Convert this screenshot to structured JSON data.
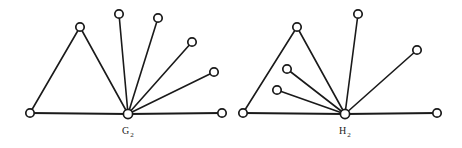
{
  "figure": {
    "background_color": "#ffffff",
    "ink_color": "#1a1a1a",
    "width": 462,
    "height": 148,
    "caption": ""
  },
  "graphs": [
    {
      "id": "G2",
      "label_base": "G",
      "label_subscript": "2",
      "label_full": "G2",
      "label_position": {
        "x": 128,
        "y": 134
      },
      "node_count": 8,
      "edge_count": 8,
      "hub_node_id": "g-hub",
      "nodes": [
        {
          "id": "g-base-left",
          "name": "base-left-vertex",
          "x": 30,
          "y": 113,
          "r": 4.2
        },
        {
          "id": "g-apex",
          "name": "triangle-apex",
          "x": 80,
          "y": 27,
          "r": 4.2
        },
        {
          "id": "g-hub",
          "name": "hub-vertex",
          "x": 128,
          "y": 114,
          "r": 4.6
        },
        {
          "id": "g-fan-1",
          "name": "fan-vertex-1",
          "x": 119,
          "y": 14,
          "r": 4.2
        },
        {
          "id": "g-fan-2",
          "name": "fan-vertex-2",
          "x": 158,
          "y": 18,
          "r": 4.2
        },
        {
          "id": "g-fan-3",
          "name": "fan-vertex-3",
          "x": 192,
          "y": 42,
          "r": 4.2
        },
        {
          "id": "g-fan-4",
          "name": "fan-vertex-4",
          "x": 214,
          "y": 72,
          "r": 4.2
        },
        {
          "id": "g-base-right",
          "name": "base-right-vertex",
          "x": 222,
          "y": 113,
          "r": 4.2
        }
      ],
      "edges": [
        {
          "from": "g-base-left",
          "to": "g-apex",
          "kind": "triangle"
        },
        {
          "from": "g-apex",
          "to": "g-hub",
          "kind": "triangle"
        },
        {
          "from": "g-base-left",
          "to": "g-hub",
          "kind": "base"
        },
        {
          "from": "g-hub",
          "to": "g-fan-1",
          "kind": "spoke"
        },
        {
          "from": "g-hub",
          "to": "g-fan-2",
          "kind": "spoke"
        },
        {
          "from": "g-hub",
          "to": "g-fan-3",
          "kind": "spoke"
        },
        {
          "from": "g-hub",
          "to": "g-fan-4",
          "kind": "spoke"
        },
        {
          "from": "g-hub",
          "to": "g-base-right",
          "kind": "base"
        }
      ]
    },
    {
      "id": "H2",
      "label_base": "H",
      "label_subscript": "2",
      "label_full": "H2",
      "label_position": {
        "x": 345,
        "y": 134
      },
      "node_count": 8,
      "edge_count": 8,
      "hub_node_id": "h-hub",
      "nodes": [
        {
          "id": "h-base-left",
          "name": "base-left-vertex",
          "x": 243,
          "y": 113,
          "r": 4.2
        },
        {
          "id": "h-apex",
          "name": "triangle-apex",
          "x": 297,
          "y": 27,
          "r": 4.2
        },
        {
          "id": "h-hub",
          "name": "hub-vertex",
          "x": 345,
          "y": 114,
          "r": 4.6
        },
        {
          "id": "h-pendant-1",
          "name": "pendant-vertex-1",
          "x": 287,
          "y": 69,
          "r": 4.2
        },
        {
          "id": "h-pendant-2",
          "name": "pendant-vertex-2",
          "x": 277,
          "y": 90,
          "r": 4.2
        },
        {
          "id": "h-fan-top",
          "name": "fan-vertex-top",
          "x": 358,
          "y": 14,
          "r": 4.2
        },
        {
          "id": "h-fan-right",
          "name": "fan-vertex-right",
          "x": 417,
          "y": 50,
          "r": 4.2
        },
        {
          "id": "h-base-right",
          "name": "base-right-vertex",
          "x": 437,
          "y": 113,
          "r": 4.2
        }
      ],
      "edges": [
        {
          "from": "h-base-left",
          "to": "h-apex",
          "kind": "triangle"
        },
        {
          "from": "h-apex",
          "to": "h-hub",
          "kind": "triangle"
        },
        {
          "from": "h-base-left",
          "to": "h-hub",
          "kind": "base"
        },
        {
          "from": "h-hub",
          "to": "h-pendant-1",
          "kind": "spoke"
        },
        {
          "from": "h-hub",
          "to": "h-pendant-2",
          "kind": "spoke"
        },
        {
          "from": "h-hub",
          "to": "h-fan-top",
          "kind": "spoke"
        },
        {
          "from": "h-hub",
          "to": "h-fan-right",
          "kind": "spoke"
        },
        {
          "from": "h-hub",
          "to": "h-base-right",
          "kind": "base"
        }
      ]
    }
  ]
}
